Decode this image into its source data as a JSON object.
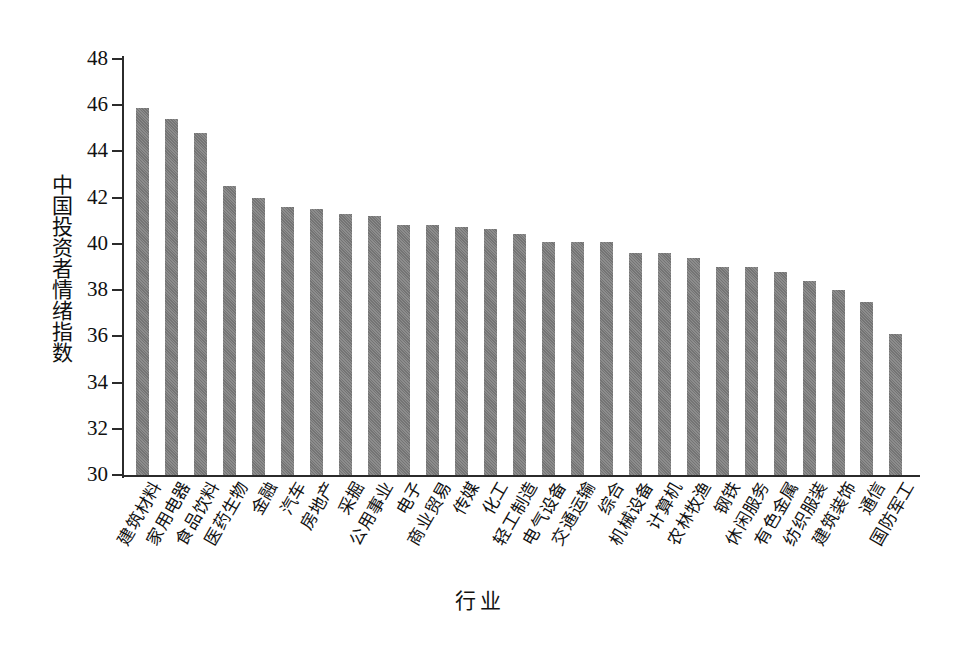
{
  "chart_data": {
    "type": "bar",
    "title": "",
    "xlabel": "行业",
    "ylabel": "中国投资者情绪指数",
    "ylim": [
      30,
      48
    ],
    "yticks": [
      30,
      32,
      34,
      36,
      38,
      40,
      42,
      44,
      46,
      48
    ],
    "grid": false,
    "legend": null,
    "bar_color": "#7a7a7a",
    "axis_color": "#2b2b2b",
    "categories": [
      "建筑材料",
      "家用电器",
      "食品饮料",
      "医药生物",
      "金融",
      "汽车",
      "房地产",
      "采掘",
      "公用事业",
      "电子",
      "商业贸易",
      "传媒",
      "化工",
      "轻工制造",
      "电气设备",
      "交通运输",
      "综合",
      "机械设备",
      "计算机",
      "农林牧渔",
      "钢铁",
      "休闲服务",
      "有色金属",
      "纺织服装",
      "建筑装饰",
      "通信",
      "国防军工"
    ],
    "values": [
      45.9,
      45.4,
      44.8,
      42.5,
      42.0,
      41.6,
      41.5,
      41.3,
      41.2,
      40.8,
      40.8,
      40.75,
      40.65,
      40.45,
      40.1,
      40.1,
      40.1,
      39.6,
      39.6,
      39.4,
      39.0,
      39.0,
      38.8,
      38.4,
      38.0,
      37.5,
      36.1
    ]
  }
}
